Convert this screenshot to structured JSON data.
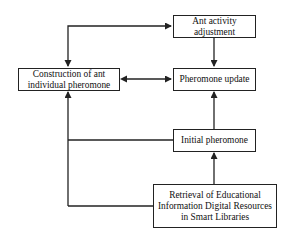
{
  "diagram": {
    "type": "flowchart",
    "nodes": [
      {
        "id": "ant_activity",
        "lines": [
          "Ant activity",
          "adjustment"
        ]
      },
      {
        "id": "construction",
        "lines": [
          "Construction of ant",
          "individual pheromone"
        ]
      },
      {
        "id": "pheromone_update",
        "lines": [
          "Pheromone update"
        ]
      },
      {
        "id": "initial_pheromone",
        "lines": [
          "Initial pheromone"
        ]
      },
      {
        "id": "retrieval",
        "lines": [
          "Retrieval of Educational",
          "Information Digital Resources",
          "in Smart Libraries"
        ]
      }
    ],
    "edges": [
      {
        "from": "construction",
        "to": "ant_activity",
        "bidirectional": true
      },
      {
        "from": "ant_activity",
        "to": "pheromone_update",
        "bidirectional": false
      },
      {
        "from": "construction",
        "to": "pheromone_update",
        "bidirectional": true
      },
      {
        "from": "initial_pheromone",
        "to": "pheromone_update",
        "bidirectional": false
      },
      {
        "from": "retrieval",
        "to": "initial_pheromone",
        "bidirectional": false
      },
      {
        "from": "initial_pheromone",
        "to": "construction",
        "bidirectional": false
      },
      {
        "from": "retrieval",
        "to": "construction",
        "bidirectional": false
      }
    ],
    "line_color": "#222222",
    "background": "#ffffff"
  }
}
